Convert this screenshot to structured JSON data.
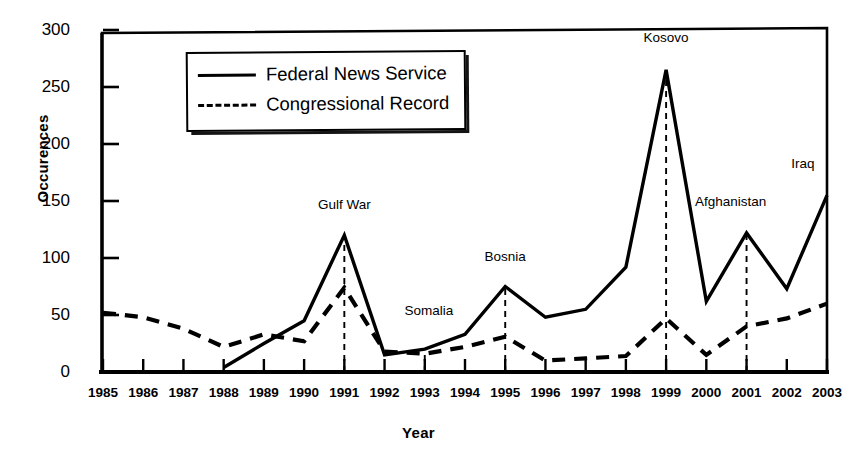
{
  "chart_data": {
    "type": "line",
    "title": "",
    "xlabel": "Year",
    "ylabel": "Occurences",
    "grid": false,
    "legend_position": "top-left-inside",
    "xlim": [
      1985,
      2003
    ],
    "ylim": [
      0,
      300
    ],
    "ytick_values": [
      0,
      50,
      100,
      150,
      200,
      250,
      300
    ],
    "ytick_labels": [
      "0",
      "50",
      "100",
      "150",
      "200",
      "250",
      "300"
    ],
    "categories": [
      1985,
      1986,
      1987,
      1988,
      1989,
      1990,
      1991,
      1992,
      1993,
      1994,
      1995,
      1996,
      1997,
      1998,
      1999,
      2000,
      2001,
      2002,
      2003
    ],
    "xtick_labels": [
      "1985",
      "1986",
      "1987",
      "1988",
      "1989",
      "1990",
      "1991",
      "1992",
      "1993",
      "1994",
      "1995",
      "1996",
      "1997",
      "1998",
      "1999",
      "2000",
      "2001",
      "2002",
      "2003"
    ],
    "series": [
      {
        "name": "Federal News Service",
        "style": "solid",
        "color": "#000000",
        "x": [
          1988,
          1989,
          1990,
          1991,
          1992,
          1993,
          1994,
          1995,
          1996,
          1997,
          1998,
          1999,
          2000,
          2001,
          2002,
          2003
        ],
        "values": [
          4,
          25,
          45,
          120,
          15,
          20,
          33,
          75,
          48,
          55,
          92,
          265,
          62,
          122,
          73,
          155
        ]
      },
      {
        "name": "Congressional Record",
        "style": "dashed",
        "color": "#000000",
        "x": [
          1985,
          1986,
          1987,
          1988,
          1989,
          1990,
          1991,
          1992,
          1993,
          1994,
          1995,
          1996,
          1997,
          1998,
          1999,
          2000,
          2001,
          2002,
          2003
        ],
        "values": [
          52,
          48,
          38,
          22,
          33,
          27,
          74,
          18,
          16,
          22,
          31,
          10,
          12,
          14,
          47,
          15,
          40,
          47,
          60
        ]
      }
    ],
    "annotations": [
      {
        "label": "Gulf War",
        "year": 1991,
        "value": 120,
        "label_y": 140
      },
      {
        "label": "Somalia",
        "year": 1993,
        "value": 20,
        "label_y": 47
      },
      {
        "label": "Bosnia",
        "year": 1995,
        "value": 75,
        "label_y": 95
      },
      {
        "label": "Kosovo",
        "year": 1999,
        "value": 265,
        "label_y": 287
      },
      {
        "label": "Afghanistan",
        "year": 2001,
        "value": 122,
        "label_y": 143
      },
      {
        "label": "Iraq",
        "year": 2003,
        "value": 155,
        "label_y": 176
      }
    ]
  },
  "legend": {
    "items": [
      {
        "label": "Federal News Service",
        "style": "solid"
      },
      {
        "label": "Congressional Record",
        "style": "dashed"
      }
    ]
  }
}
